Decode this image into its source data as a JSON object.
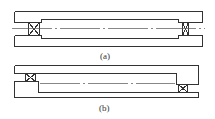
{
  "figures": [
    {
      "id": "a",
      "label": "(a)",
      "description": "Shaft supported by two bearings, both fixed at the same level between upper and lower housings"
    },
    {
      "id": "b",
      "label": "(b)",
      "description": "Shaft with bearings at staggered positions: left bearing upper, right bearing lower"
    }
  ],
  "colors": {
    "line": "#333333",
    "background": "#ffffff"
  }
}
